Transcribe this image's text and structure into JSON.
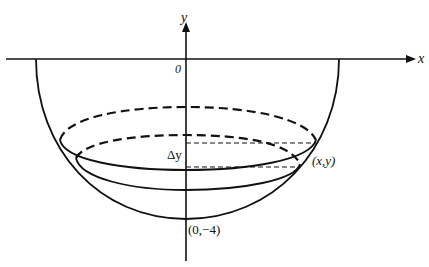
{
  "diagram": {
    "title_fragment": "",
    "axes": {
      "x_label": "x",
      "y_label": "y",
      "origin_label": "0"
    },
    "labels": {
      "delta_y": "Δy",
      "point": "(x,y)",
      "bottom_point": "(0,−4)"
    },
    "shape": "hemispherical bowl with horizontal slab of thickness Δy",
    "colors": {
      "ink": "#111111",
      "background": "#ffffff"
    }
  }
}
